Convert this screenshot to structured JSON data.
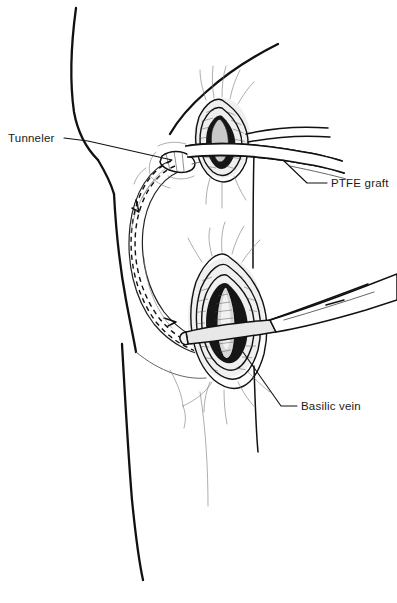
{
  "figure": {
    "domain": "medical-illustration",
    "style": "black-and-white line drawing",
    "canvas": {
      "width": 397,
      "height": 603
    },
    "background_color": "#ffffff",
    "ink_color": "#111111"
  },
  "annotations": [
    {
      "id": "tunneler",
      "label": "Tunneler",
      "text_x": 8,
      "text_y": 142,
      "anchor": "start",
      "leader": "M 64,138 L 88,141 L 172,160",
      "describes": "curved subcutaneous tunneling device passing beneath the skin of the upper arm"
    },
    {
      "id": "ptfe-graft",
      "label": "PTFE graft",
      "text_x": 331,
      "text_y": 187,
      "anchor": "start",
      "leader": "M 327,183 L 307,183 L 283,160",
      "describes": "polytetrafluoroethylene vascular graft emerging from the upper incision"
    },
    {
      "id": "basilic-vein",
      "label": "Basilic vein",
      "text_x": 301,
      "text_y": 410,
      "anchor": "start",
      "leader": "M 297,406 L 281,406 L 243,352",
      "describes": "basilic vein exposed within the lower antecubital incision"
    }
  ],
  "anatomy": {
    "parts": [
      {
        "name": "shoulder-chest-outline",
        "visible": true
      },
      {
        "name": "upper-arm-outline",
        "visible": true
      },
      {
        "name": "forearm-outline",
        "visible": true
      },
      {
        "name": "antecubital-crease",
        "visible": true
      },
      {
        "name": "axillary-fold",
        "visible": true
      }
    ]
  },
  "surgical_elements": [
    {
      "name": "upper-incision",
      "type": "wound",
      "center_x": 222,
      "center_y": 137,
      "description": "elliptical upper-arm incision with retracted skin edges exposing graft"
    },
    {
      "name": "lower-incision",
      "type": "wound",
      "center_x": 227,
      "center_y": 317,
      "description": "elliptical antecubital incision exposing the basilic vein"
    },
    {
      "name": "subcutaneous-tunnel",
      "type": "tunnel-path",
      "description": "dashed loop path of the subcutaneous tunnel between the two incisions"
    },
    {
      "name": "tunneler-instrument",
      "type": "instrument",
      "description": "long metal tunneler rod with handle entering the lower incision from the right"
    },
    {
      "name": "ptfe-graft-tube",
      "type": "graft",
      "description": "graft tubing drawn through the upper incision toward the right"
    }
  ]
}
